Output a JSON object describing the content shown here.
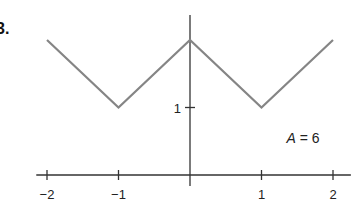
{
  "problem_label": "3.",
  "chart_data": {
    "type": "line",
    "title": "",
    "xlabel": "",
    "ylabel": "",
    "x": [
      -2,
      -1,
      0,
      1,
      2
    ],
    "series": [
      {
        "name": "f(x)",
        "values": [
          2,
          1,
          2,
          1,
          2
        ]
      }
    ],
    "x_ticks": [
      -2,
      -1,
      0,
      1,
      2
    ],
    "x_tick_labels": [
      "−2",
      "−1",
      "",
      "1",
      "2"
    ],
    "y_ticks": [
      1
    ],
    "y_tick_labels": [
      "1"
    ],
    "xlim": [
      -2.15,
      2.25
    ],
    "ylim": [
      0,
      2.3
    ],
    "grid": false,
    "legend": null,
    "annotations": [
      {
        "text": "A = 6",
        "italic_var": "A",
        "rest": " = 6",
        "x": 1.35,
        "y": 0.55
      }
    ],
    "line_color": "#858585",
    "axis_color": "#333333"
  }
}
